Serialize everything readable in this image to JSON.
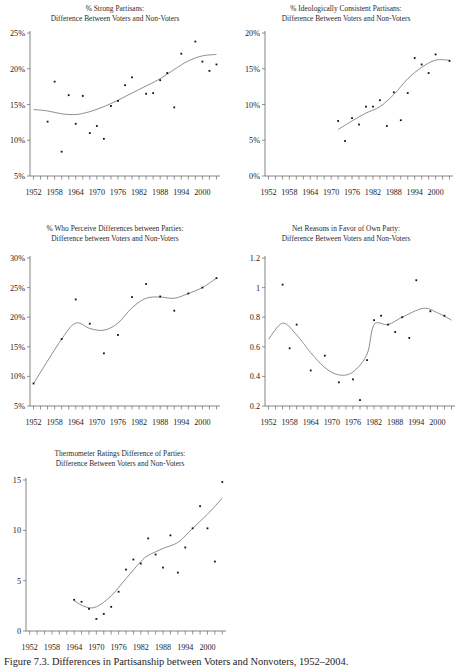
{
  "figure": {
    "caption": "Figure 7.3. Differences in Partisanship between Voters and Nonvoters, 1952–2004."
  },
  "chart_data": [
    {
      "id": "strong-partisans",
      "type": "scatter",
      "title": "% Strong Partisans:",
      "subtitle": "Difference Between Voters and Non-Voters",
      "xlabel": "",
      "ylabel": "",
      "xlim": [
        1951,
        2005
      ],
      "ylim": [
        5,
        25
      ],
      "yticks": [
        5,
        10,
        15,
        20,
        25
      ],
      "ytick_labels": [
        "5%",
        "10%",
        "15%",
        "20%",
        "25%"
      ],
      "xticks": [
        1952,
        1954,
        1956,
        1958,
        1960,
        1962,
        1964,
        1966,
        1968,
        1970,
        1972,
        1974,
        1976,
        1978,
        1980,
        1982,
        1984,
        1986,
        1988,
        1990,
        1992,
        1994,
        1996,
        1998,
        2000,
        2002,
        2004
      ],
      "xtick_labels": [
        "1952",
        "1958",
        "1964",
        "1970",
        "1976",
        "1982",
        "1988",
        "1994",
        "2000"
      ],
      "xtick_label_values": [
        1952,
        1958,
        1964,
        1970,
        1976,
        1982,
        1988,
        1994,
        2000
      ],
      "grid": false,
      "legend": "none",
      "points": [
        {
          "x": 1956,
          "y": 12.6
        },
        {
          "x": 1958,
          "y": 18.2
        },
        {
          "x": 1960,
          "y": 8.4
        },
        {
          "x": 1962,
          "y": 16.3
        },
        {
          "x": 1964,
          "y": 12.3
        },
        {
          "x": 1966,
          "y": 16.2
        },
        {
          "x": 1968,
          "y": 11.0
        },
        {
          "x": 1970,
          "y": 12.0
        },
        {
          "x": 1972,
          "y": 10.2
        },
        {
          "x": 1974,
          "y": 14.8
        },
        {
          "x": 1976,
          "y": 15.5
        },
        {
          "x": 1978,
          "y": 17.7
        },
        {
          "x": 1980,
          "y": 18.8
        },
        {
          "x": 1984,
          "y": 16.5
        },
        {
          "x": 1986,
          "y": 16.6
        },
        {
          "x": 1988,
          "y": 18.4
        },
        {
          "x": 1990,
          "y": 19.4
        },
        {
          "x": 1992,
          "y": 14.6
        },
        {
          "x": 1994,
          "y": 22.1
        },
        {
          "x": 1998,
          "y": 23.8
        },
        {
          "x": 2000,
          "y": 21.0
        },
        {
          "x": 2002,
          "y": 19.7
        },
        {
          "x": 2004,
          "y": 20.6
        }
      ],
      "trend": [
        {
          "x": 1952,
          "y": 14.3
        },
        {
          "x": 1956,
          "y": 14.1
        },
        {
          "x": 1960,
          "y": 13.7
        },
        {
          "x": 1964,
          "y": 13.6
        },
        {
          "x": 1968,
          "y": 14.0
        },
        {
          "x": 1972,
          "y": 14.7
        },
        {
          "x": 1976,
          "y": 15.6
        },
        {
          "x": 1980,
          "y": 16.6
        },
        {
          "x": 1984,
          "y": 17.6
        },
        {
          "x": 1988,
          "y": 18.6
        },
        {
          "x": 1992,
          "y": 19.9
        },
        {
          "x": 1996,
          "y": 21.1
        },
        {
          "x": 2000,
          "y": 21.8
        },
        {
          "x": 2004,
          "y": 22.0
        }
      ]
    },
    {
      "id": "ideologically-consistent-partisans",
      "type": "scatter",
      "title": "% Ideologically Consistent Partisans:",
      "subtitle": "Difference Between Voters and Non-Voters",
      "xlabel": "",
      "ylabel": "",
      "xlim": [
        1951,
        2005
      ],
      "ylim": [
        0,
        20
      ],
      "yticks": [
        0,
        5,
        10,
        15,
        20
      ],
      "ytick_labels": [
        "0%",
        "5%",
        "10%",
        "15%",
        "20%"
      ],
      "xticks": [
        1952,
        1954,
        1956,
        1958,
        1960,
        1962,
        1964,
        1966,
        1968,
        1970,
        1972,
        1974,
        1976,
        1978,
        1980,
        1982,
        1984,
        1986,
        1988,
        1990,
        1992,
        1994,
        1996,
        1998,
        2000,
        2002,
        2004
      ],
      "xtick_labels": [
        "1952",
        "1958",
        "1964",
        "1970",
        "1976",
        "1982",
        "1988",
        "1994",
        "2000"
      ],
      "xtick_label_values": [
        1952,
        1958,
        1964,
        1970,
        1976,
        1982,
        1988,
        1994,
        2000
      ],
      "grid": false,
      "legend": "none",
      "points": [
        {
          "x": 1972,
          "y": 7.7
        },
        {
          "x": 1974,
          "y": 4.9
        },
        {
          "x": 1976,
          "y": 8.1
        },
        {
          "x": 1978,
          "y": 7.2
        },
        {
          "x": 1980,
          "y": 9.7
        },
        {
          "x": 1982,
          "y": 9.7
        },
        {
          "x": 1984,
          "y": 10.6
        },
        {
          "x": 1986,
          "y": 7.0
        },
        {
          "x": 1988,
          "y": 11.7
        },
        {
          "x": 1990,
          "y": 7.8
        },
        {
          "x": 1992,
          "y": 11.6
        },
        {
          "x": 1994,
          "y": 16.5
        },
        {
          "x": 1996,
          "y": 15.6
        },
        {
          "x": 1998,
          "y": 14.4
        },
        {
          "x": 2000,
          "y": 17.0
        },
        {
          "x": 2004,
          "y": 16.1
        }
      ],
      "trend": [
        {
          "x": 1972,
          "y": 6.5
        },
        {
          "x": 1976,
          "y": 7.7
        },
        {
          "x": 1980,
          "y": 8.8
        },
        {
          "x": 1984,
          "y": 9.7
        },
        {
          "x": 1988,
          "y": 11.4
        },
        {
          "x": 1992,
          "y": 13.6
        },
        {
          "x": 1996,
          "y": 15.2
        },
        {
          "x": 2000,
          "y": 16.2
        },
        {
          "x": 2004,
          "y": 16.2
        }
      ]
    },
    {
      "id": "perceive-differences-between-parties",
      "type": "scatter",
      "title": "% Who Perceive Differences between Parties:",
      "subtitle": "Difference between Voters and Non-Voters",
      "xlabel": "",
      "ylabel": "",
      "xlim": [
        1951,
        2005
      ],
      "ylim": [
        5,
        30
      ],
      "yticks": [
        5,
        10,
        15,
        20,
        25,
        30
      ],
      "ytick_labels": [
        "5%",
        "10%",
        "15%",
        "20%",
        "25%",
        "30%"
      ],
      "xticks": [
        1952,
        1954,
        1956,
        1958,
        1960,
        1962,
        1964,
        1966,
        1968,
        1970,
        1972,
        1974,
        1976,
        1978,
        1980,
        1982,
        1984,
        1986,
        1988,
        1990,
        1992,
        1994,
        1996,
        1998,
        2000,
        2002,
        2004
      ],
      "xtick_labels": [
        "1952",
        "1958",
        "1964",
        "1970",
        "1976",
        "1982",
        "1988",
        "1994",
        "2000"
      ],
      "xtick_label_values": [
        1952,
        1958,
        1964,
        1970,
        1976,
        1982,
        1988,
        1994,
        2000
      ],
      "grid": false,
      "legend": "none",
      "points": [
        {
          "x": 1952,
          "y": 8.8
        },
        {
          "x": 1960,
          "y": 16.3
        },
        {
          "x": 1964,
          "y": 23.0
        },
        {
          "x": 1968,
          "y": 18.9
        },
        {
          "x": 1972,
          "y": 13.9
        },
        {
          "x": 1976,
          "y": 17.0
        },
        {
          "x": 1980,
          "y": 23.4
        },
        {
          "x": 1984,
          "y": 25.6
        },
        {
          "x": 1988,
          "y": 23.5
        },
        {
          "x": 1992,
          "y": 21.1
        },
        {
          "x": 1996,
          "y": 24.0
        },
        {
          "x": 2000,
          "y": 25.0
        },
        {
          "x": 2004,
          "y": 26.6
        }
      ],
      "trend": [
        {
          "x": 1952,
          "y": 8.8
        },
        {
          "x": 1960,
          "y": 16.3
        },
        {
          "x": 1964,
          "y": 19.0
        },
        {
          "x": 1968,
          "y": 18.1
        },
        {
          "x": 1972,
          "y": 17.8
        },
        {
          "x": 1976,
          "y": 19.0
        },
        {
          "x": 1980,
          "y": 21.6
        },
        {
          "x": 1984,
          "y": 23.2
        },
        {
          "x": 1988,
          "y": 23.4
        },
        {
          "x": 1992,
          "y": 23.2
        },
        {
          "x": 1996,
          "y": 24.0
        },
        {
          "x": 2000,
          "y": 25.0
        },
        {
          "x": 2004,
          "y": 26.6
        }
      ]
    },
    {
      "id": "net-reasons-favor-own-party",
      "type": "scatter",
      "title": "Net Reasons in Favor of Own Party:",
      "subtitle": "Difference Between Voters and Non-Voters",
      "xlabel": "",
      "ylabel": "",
      "xlim": [
        1951,
        2005
      ],
      "ylim": [
        0.2,
        1.2
      ],
      "yticks": [
        0.2,
        0.4,
        0.6,
        0.8,
        1,
        1.2
      ],
      "ytick_labels": [
        "0.2",
        "0.4",
        "0.6",
        "0.8",
        "1",
        "1.2"
      ],
      "xticks": [
        1952,
        1954,
        1956,
        1958,
        1960,
        1962,
        1964,
        1966,
        1968,
        1970,
        1972,
        1974,
        1976,
        1978,
        1980,
        1982,
        1984,
        1986,
        1988,
        1990,
        1992,
        1994,
        1996,
        1998,
        2000,
        2002,
        2004
      ],
      "xtick_labels": [
        "1952",
        "1958",
        "1964",
        "1970",
        "1976",
        "1982",
        "1988",
        "1994",
        "2000"
      ],
      "xtick_label_values": [
        1952,
        1958,
        1964,
        1970,
        1976,
        1982,
        1988,
        1994,
        2000
      ],
      "grid": false,
      "legend": "none",
      "points": [
        {
          "x": 1956,
          "y": 1.02
        },
        {
          "x": 1958,
          "y": 0.59
        },
        {
          "x": 1960,
          "y": 0.75
        },
        {
          "x": 1964,
          "y": 0.44
        },
        {
          "x": 1968,
          "y": 0.54
        },
        {
          "x": 1972,
          "y": 0.36
        },
        {
          "x": 1976,
          "y": 0.38
        },
        {
          "x": 1978,
          "y": 0.24
        },
        {
          "x": 1980,
          "y": 0.51
        },
        {
          "x": 1982,
          "y": 0.78
        },
        {
          "x": 1984,
          "y": 0.81
        },
        {
          "x": 1986,
          "y": 0.75
        },
        {
          "x": 1988,
          "y": 0.7
        },
        {
          "x": 1990,
          "y": 0.8
        },
        {
          "x": 1992,
          "y": 0.66
        },
        {
          "x": 1994,
          "y": 1.05
        },
        {
          "x": 1998,
          "y": 0.84
        },
        {
          "x": 2002,
          "y": 0.81
        }
      ],
      "trend": [
        {
          "x": 1952,
          "y": 0.65
        },
        {
          "x": 1956,
          "y": 0.76
        },
        {
          "x": 1960,
          "y": 0.68
        },
        {
          "x": 1964,
          "y": 0.56
        },
        {
          "x": 1968,
          "y": 0.46
        },
        {
          "x": 1972,
          "y": 0.41
        },
        {
          "x": 1976,
          "y": 0.43
        },
        {
          "x": 1980,
          "y": 0.55
        },
        {
          "x": 1982,
          "y": 0.75
        },
        {
          "x": 1986,
          "y": 0.75
        },
        {
          "x": 1990,
          "y": 0.8
        },
        {
          "x": 1996,
          "y": 0.86
        },
        {
          "x": 2000,
          "y": 0.83
        },
        {
          "x": 2004,
          "y": 0.78
        }
      ]
    },
    {
      "id": "thermometer-ratings-difference",
      "type": "scatter",
      "title": "Thermometer Ratings Difference of Parties:",
      "subtitle": "Difference Between Voters and Non-Voters",
      "xlabel": "",
      "ylabel": "",
      "xlim": [
        1951,
        2005
      ],
      "ylim": [
        0,
        15
      ],
      "yticks": [
        0,
        5,
        10,
        15
      ],
      "ytick_labels": [
        "0",
        "5",
        "10",
        "15"
      ],
      "xticks": [
        1952,
        1954,
        1956,
        1958,
        1960,
        1962,
        1964,
        1966,
        1968,
        1970,
        1972,
        1974,
        1976,
        1978,
        1980,
        1982,
        1984,
        1986,
        1988,
        1990,
        1992,
        1994,
        1996,
        1998,
        2000,
        2002,
        2004
      ],
      "xtick_labels": [
        "1952",
        "1958",
        "1964",
        "1970",
        "1976",
        "1982",
        "1988",
        "1994",
        "2000"
      ],
      "xtick_label_values": [
        1952,
        1958,
        1964,
        1970,
        1976,
        1982,
        1988,
        1994,
        2000
      ],
      "grid": false,
      "legend": "none",
      "points": [
        {
          "x": 1964,
          "y": 3.1
        },
        {
          "x": 1966,
          "y": 2.9
        },
        {
          "x": 1968,
          "y": 2.2
        },
        {
          "x": 1970,
          "y": 1.2
        },
        {
          "x": 1972,
          "y": 1.7
        },
        {
          "x": 1974,
          "y": 2.4
        },
        {
          "x": 1976,
          "y": 3.9
        },
        {
          "x": 1978,
          "y": 6.1
        },
        {
          "x": 1980,
          "y": 7.1
        },
        {
          "x": 1982,
          "y": 6.7
        },
        {
          "x": 1984,
          "y": 9.2
        },
        {
          "x": 1986,
          "y": 7.6
        },
        {
          "x": 1988,
          "y": 6.3
        },
        {
          "x": 1990,
          "y": 9.5
        },
        {
          "x": 1992,
          "y": 5.8
        },
        {
          "x": 1994,
          "y": 8.3
        },
        {
          "x": 1996,
          "y": 10.2
        },
        {
          "x": 1998,
          "y": 12.4
        },
        {
          "x": 2000,
          "y": 10.2
        },
        {
          "x": 2002,
          "y": 6.9
        },
        {
          "x": 2004,
          "y": 14.8
        }
      ],
      "trend": [
        {
          "x": 1964,
          "y": 3.0
        },
        {
          "x": 1967,
          "y": 2.4
        },
        {
          "x": 1970,
          "y": 2.4
        },
        {
          "x": 1974,
          "y": 3.5
        },
        {
          "x": 1978,
          "y": 5.2
        },
        {
          "x": 1982,
          "y": 6.9
        },
        {
          "x": 1984,
          "y": 7.5
        },
        {
          "x": 1988,
          "y": 8.2
        },
        {
          "x": 1992,
          "y": 8.8
        },
        {
          "x": 1996,
          "y": 10.2
        },
        {
          "x": 2000,
          "y": 11.6
        },
        {
          "x": 2004,
          "y": 13.2
        }
      ]
    }
  ]
}
